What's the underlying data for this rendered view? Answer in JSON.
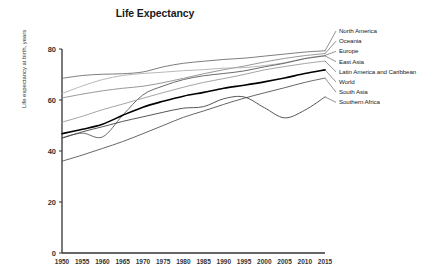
{
  "chart_data": {
    "type": "line",
    "title": "Life Expectancy",
    "xlabel": "",
    "ylabel": "Life expectancy at birth, years",
    "xlim": [
      1950,
      2015
    ],
    "ylim": [
      0,
      80
    ],
    "yticks": [
      0,
      20,
      40,
      60,
      80
    ],
    "xticks": [
      1950,
      1955,
      1960,
      1965,
      1970,
      1975,
      1980,
      1985,
      1990,
      1995,
      2000,
      2005,
      2010,
      2015
    ],
    "grid": false,
    "legend_position": "right-inline-labels",
    "x": [
      1950,
      1955,
      1960,
      1965,
      1970,
      1975,
      1980,
      1985,
      1990,
      1995,
      2000,
      2005,
      2010,
      2015
    ],
    "series": [
      {
        "name": "North America",
        "color": "#6e6e6e",
        "width": 0.9,
        "values": [
          68.5,
          69.6,
          70.1,
          70.3,
          71.0,
          73.0,
          74.4,
          75.2,
          75.9,
          76.4,
          77.2,
          78.0,
          78.8,
          79.3
        ]
      },
      {
        "name": "Oceania",
        "color": "#8c8c8c",
        "width": 0.9,
        "values": [
          60.8,
          62.3,
          63.6,
          64.6,
          65.4,
          66.8,
          68.5,
          70.3,
          71.9,
          73.3,
          74.9,
          76.3,
          77.4,
          78.2
        ]
      },
      {
        "name": "Europe",
        "color": "#b0b0b0",
        "width": 0.9,
        "values": [
          62.5,
          65.5,
          68.0,
          69.6,
          70.4,
          70.9,
          71.5,
          71.9,
          72.5,
          72.7,
          73.5,
          74.6,
          76.3,
          77.5
        ]
      },
      {
        "name": "East Asia",
        "color": "#5a5a5a",
        "width": 0.9,
        "values": [
          45.2,
          47.0,
          45.5,
          54.0,
          62.0,
          65.5,
          68.0,
          69.5,
          70.4,
          71.4,
          73.0,
          74.4,
          76.2,
          77.3
        ]
      },
      {
        "name": "Latin America and Caribbean",
        "color": "#9a9a9a",
        "width": 0.9,
        "values": [
          51.3,
          53.6,
          56.2,
          58.4,
          60.7,
          62.9,
          65.0,
          66.9,
          68.4,
          70.0,
          71.8,
          73.1,
          74.3,
          75.3
        ]
      },
      {
        "name": "World",
        "color": "#000000",
        "width": 1.6,
        "values": [
          46.8,
          48.5,
          50.5,
          54.0,
          57.2,
          59.5,
          61.5,
          63.0,
          64.6,
          65.8,
          67.1,
          68.6,
          70.4,
          71.8
        ]
      },
      {
        "name": "South Asia",
        "color": "#555555",
        "width": 0.9,
        "values": [
          36.0,
          38.4,
          41.0,
          43.7,
          46.8,
          50.0,
          53.2,
          55.7,
          58.3,
          60.7,
          62.8,
          64.8,
          66.9,
          68.6
        ]
      },
      {
        "name": "Southern Africa",
        "color": "#444444",
        "width": 0.9,
        "values": [
          45.0,
          47.5,
          49.5,
          51.6,
          53.4,
          55.2,
          56.8,
          57.4,
          60.5,
          61.2,
          57.0,
          53.0,
          56.0,
          61.2
        ]
      }
    ]
  },
  "legend_labels": [
    "North America",
    "Oceania",
    "Europe",
    "East Asia",
    "Latin America and Caribbean",
    "World",
    "South Asia",
    "Southern Africa"
  ]
}
